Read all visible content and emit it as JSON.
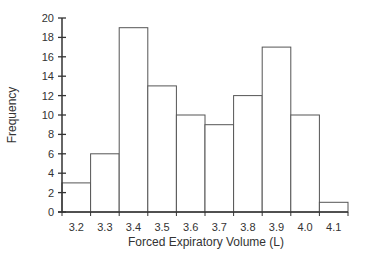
{
  "chart_data": {
    "type": "bar",
    "subtype": "histogram",
    "title": "",
    "xlabel": "Forced Expiratory Volume (L)",
    "ylabel": "Frequency",
    "categories": [
      "3.2",
      "3.3",
      "3.4",
      "3.5",
      "3.6",
      "3.7",
      "3.8",
      "3.9",
      "4.0",
      "4.1"
    ],
    "values": [
      3,
      6,
      19,
      13,
      10,
      9,
      12,
      17,
      10,
      1
    ],
    "yticks": [
      0,
      2,
      4,
      6,
      8,
      10,
      12,
      14,
      16,
      18,
      20
    ],
    "ylim": [
      0,
      20
    ],
    "grid": false,
    "legend": null,
    "colors": {
      "bar_fill": "#ffffff",
      "bar_stroke": "#555555",
      "axis": "#333333"
    }
  }
}
